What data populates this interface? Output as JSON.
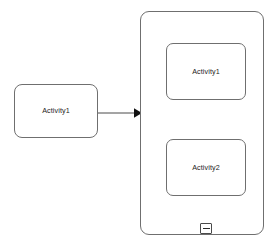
{
  "diagram": {
    "background_color": "#ffffff",
    "stroke_color": "#6f6f6f",
    "text_color": "#1c1c1c",
    "nodes": [
      {
        "id": "left-activity",
        "label": "Activity1",
        "shape": "rounded-rectangle",
        "x": 14,
        "y": 84,
        "width": 84,
        "height": 54
      },
      {
        "id": "inner-activity-1",
        "label": "Activity1",
        "shape": "rounded-rectangle",
        "x": 166,
        "y": 43,
        "width": 80,
        "height": 57
      },
      {
        "id": "inner-activity-2",
        "label": "Activity2",
        "shape": "rounded-rectangle",
        "x": 166,
        "y": 139,
        "width": 80,
        "height": 57
      }
    ],
    "container": {
      "id": "activity-group",
      "label": "",
      "shape": "rounded-rectangle",
      "x": 140,
      "y": 11,
      "width": 124,
      "height": 224
    },
    "edges": [
      {
        "id": "edge-left-to-container",
        "from": "left-activity",
        "to": "activity-group",
        "style": "solid",
        "arrowhead": "filled-triangle",
        "x1": 98,
        "y1": 113,
        "x2": 140,
        "y2": 113
      }
    ],
    "controls": {
      "collapse": {
        "icon": "minus-icon",
        "state": "expanded",
        "x": 200,
        "y": 223,
        "width": 12,
        "height": 11
      }
    }
  }
}
